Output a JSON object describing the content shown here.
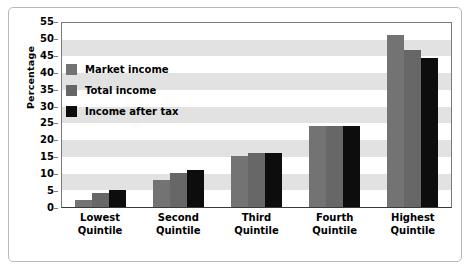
{
  "chart_data": {
    "type": "bar",
    "title": "",
    "xlabel": "",
    "ylabel": "Percentage",
    "ylim": [
      0,
      55
    ],
    "ytick_step": 5,
    "yticks": [
      0,
      5,
      10,
      15,
      20,
      25,
      30,
      35,
      40,
      45,
      50,
      55
    ],
    "grid": false,
    "alternating_bands": true,
    "legend_position": "upper-left-inside",
    "categories": [
      "Lowest\nQuintile",
      "Second\nQuintile",
      "Third\nQuintile",
      "Fourth\nQuintile",
      "Highest\nQuintile"
    ],
    "series": [
      {
        "name": "Market income",
        "color": "#737373",
        "values": [
          2,
          8,
          15,
          24,
          51
        ]
      },
      {
        "name": "Total income",
        "color": "#676767",
        "values": [
          4,
          10,
          16,
          24,
          46.5
        ]
      },
      {
        "name": "Income after tax",
        "color": "#0d0d0d",
        "values": [
          5,
          11,
          16,
          24,
          44
        ]
      }
    ]
  },
  "colors": {
    "background": "#ffffff",
    "band": "#e2e2e2",
    "axis": "#7a7a7a",
    "baseline": "#3a3a3a",
    "frame": "#b9b9b9",
    "text": "#000000"
  }
}
